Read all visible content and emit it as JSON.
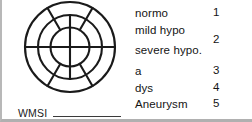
{
  "diagram": {
    "name": "wall-motion-bullseye",
    "rings": 3,
    "center_split": "vertical",
    "stroke_color": "#1a1a1a"
  },
  "wmsi": {
    "label": "WMSI",
    "value": ""
  },
  "legend": {
    "items": [
      {
        "label": "normo",
        "score": "1"
      },
      {
        "label": "mild hypo",
        "score": "2"
      },
      {
        "label": "severe hypo.",
        "score": ""
      },
      {
        "label": "a",
        "score": "3"
      },
      {
        "label": "dys",
        "score": "4"
      },
      {
        "label": "Aneurysm",
        "score": "5"
      }
    ]
  }
}
